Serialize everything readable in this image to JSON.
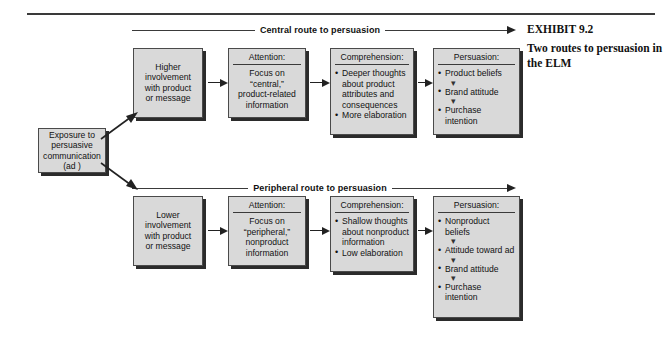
{
  "exhibit": {
    "number": "EXHIBIT 9.2",
    "title": "Two routes to persuasion in the ELM"
  },
  "routes": {
    "central": "Central route to persuasion",
    "peripheral": "Peripheral route to persuasion"
  },
  "nodes": {
    "exposure": {
      "line1": "Exposure to",
      "line2": "persuasive",
      "line3": "communication",
      "line4": "(ad )"
    },
    "higher_involvement": {
      "line1": "Higher",
      "line2": "involvement",
      "line3": "with product",
      "line4": "or message"
    },
    "attention_central": {
      "header": "Attention:",
      "line1": "Focus on",
      "line2": "“central,”",
      "line3": "product-related",
      "line4": "information"
    },
    "comprehension_central": {
      "header": "Comprehension:",
      "items": [
        "Deeper thoughts about product attributes and consequences",
        "More elaboration"
      ]
    },
    "persuasion_central": {
      "header": "Persuasion:",
      "items": [
        "Product beliefs",
        "Brand attitude",
        "Purchase intention"
      ],
      "arrow_glyph": "▾"
    },
    "lower_involvement": {
      "line1": "Lower",
      "line2": "involvement",
      "line3": "with product",
      "line4": "or message"
    },
    "attention_peripheral": {
      "header": "Attention:",
      "line1": "Focus on",
      "line2": "“peripheral,”",
      "line3": "nonproduct",
      "line4": "information"
    },
    "comprehension_peripheral": {
      "header": "Comprehension:",
      "items": [
        "Shallow thoughts about nonproduct information",
        "Low elaboration"
      ]
    },
    "persuasion_peripheral": {
      "header": "Persuasion:",
      "items": [
        "Nonproduct beliefs",
        "Attitude toward ad",
        "Brand attitude",
        "Purchase intention"
      ],
      "arrow_glyph": "▾"
    }
  },
  "colors": {
    "box_fill": "#d9d9d9",
    "box_border": "#4a4a4a",
    "box_shadow": "#2b2b2b",
    "rule": "#3a3a3a",
    "text": "#121212"
  }
}
